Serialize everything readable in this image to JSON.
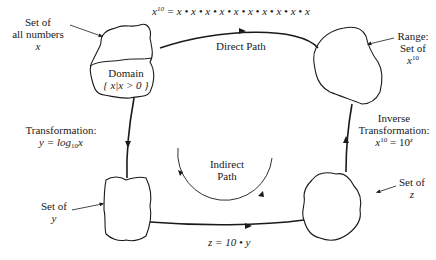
{
  "diagram": {
    "title_equation": {
      "lhs": "x",
      "lhs_exp": "10",
      "rhs": "= x • x • x • x • x • x • x • x • x • x"
    },
    "nodes": {
      "set_all_numbers": {
        "label_line1": "Set of",
        "label_line2": "all numbers",
        "label_line3": "x"
      },
      "domain": {
        "label": "Domain",
        "set_notation": "{ x|x > 0 }"
      },
      "range": {
        "label_line1": "Range:",
        "label_line2": "Set of",
        "label_var": "x",
        "label_exp": "10"
      },
      "set_y": {
        "label_line1": "Set of",
        "label_line2": "y"
      },
      "set_z": {
        "label_line1": "Set of",
        "label_line2": "z"
      }
    },
    "edges": {
      "direct_path": {
        "label": "Direct Path"
      },
      "indirect_path": {
        "label_line1": "Indirect",
        "label_line2": "Path"
      },
      "transformation": {
        "label": "Transformation:",
        "eq_lhs": "y = log",
        "eq_sub": "10",
        "eq_var": "x"
      },
      "inverse_transformation": {
        "label_line1": "Inverse",
        "label_line2": "Transformation:",
        "eq_var": "x",
        "eq_exp": "10",
        "eq_rhs": " = 10",
        "eq_rhs_exp": "z"
      },
      "y_to_z": {
        "label": "z = 10 • y"
      }
    },
    "colors": {
      "ink": "#1a1a1a",
      "background": "#ffffff"
    }
  }
}
